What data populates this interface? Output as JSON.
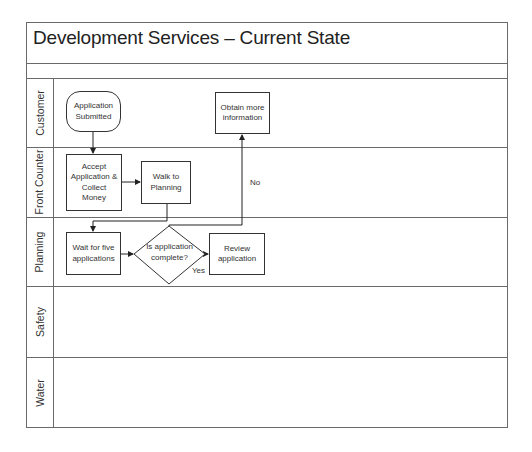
{
  "diagram": {
    "title": "Development Services – Current State",
    "lanes": [
      {
        "label": "Customer"
      },
      {
        "label": "Front Counter"
      },
      {
        "label": "Planning"
      },
      {
        "label": "Safety"
      },
      {
        "label": "Water"
      }
    ],
    "nodes": {
      "application_submitted": {
        "label_line1": "Application",
        "label_line2": "Submitted",
        "shape": "terminator",
        "lane": "Customer"
      },
      "obtain_more_info": {
        "label_line1": "Obtain more",
        "label_line2": "information",
        "shape": "process",
        "lane": "Customer"
      },
      "accept_application": {
        "label_line1": "Accept",
        "label_line2": "Application &",
        "label_line3": "Collect",
        "label_line4": "Money",
        "shape": "process",
        "lane": "Front Counter"
      },
      "walk_to_planning": {
        "label_line1": "Walk to",
        "label_line2": "Planning",
        "shape": "process",
        "lane": "Front Counter"
      },
      "wait_for_five": {
        "label_line1": "Wait for five",
        "label_line2": "applications",
        "shape": "process",
        "lane": "Planning"
      },
      "is_complete": {
        "label_line1": "Is application",
        "label_line2": "complete?",
        "shape": "decision",
        "lane": "Planning"
      },
      "review_application": {
        "label_line1": "Review",
        "label_line2": "application",
        "shape": "process",
        "lane": "Planning"
      }
    },
    "edge_labels": {
      "no": "No",
      "yes": "Yes"
    },
    "edges": [
      {
        "from": "Application Submitted",
        "to": "Accept Application & Collect Money"
      },
      {
        "from": "Accept Application & Collect Money",
        "to": "Walk to Planning"
      },
      {
        "from": "Walk to Planning",
        "to": "Wait for five applications"
      },
      {
        "from": "Wait for five applications",
        "to": "Is application complete?"
      },
      {
        "from": "Is application complete?",
        "to": "Review application",
        "label": "Yes"
      },
      {
        "from": "Is application complete?",
        "to": "Obtain more information",
        "label": "No"
      }
    ]
  }
}
